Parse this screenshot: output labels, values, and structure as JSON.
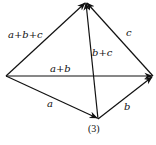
{
  "diagram": {
    "caption": "(3)",
    "points": {
      "O": [
        6,
        76
      ],
      "T": [
        86,
        2
      ],
      "R": [
        153,
        76
      ],
      "B": [
        98,
        119
      ]
    },
    "vectors": [
      {
        "id": "a",
        "label": "a",
        "from": "O",
        "to": "B"
      },
      {
        "id": "b",
        "label": "b",
        "from": "B",
        "to": "R"
      },
      {
        "id": "c",
        "label": "c",
        "from": "R",
        "to": "T"
      },
      {
        "id": "a_plus_b",
        "label": "a+b",
        "from": "O",
        "to": "R"
      },
      {
        "id": "b_plus_c",
        "label": "b+c",
        "from": "B",
        "to": "T"
      },
      {
        "id": "a_plus_b_plus_c",
        "label": "a+b+c",
        "from": "O",
        "to": "T"
      }
    ],
    "colors": {
      "stroke": "#111111",
      "background": "#ffffff"
    }
  }
}
